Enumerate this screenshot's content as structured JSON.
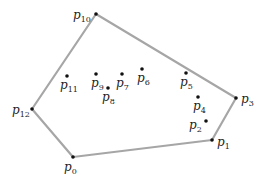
{
  "diagram": {
    "title": "",
    "hull_color": "#a6a6a6",
    "point_color": "#111111",
    "hull_order": [
      "p0",
      "p1",
      "p3",
      "p10",
      "p12"
    ],
    "points": [
      {
        "id": "p0",
        "base": "p",
        "sub": "0",
        "x": 73,
        "y": 157,
        "lx": 64,
        "ly": 171,
        "hull": true
      },
      {
        "id": "p1",
        "base": "p",
        "sub": "1",
        "x": 212,
        "y": 140,
        "lx": 217,
        "ly": 146,
        "hull": true
      },
      {
        "id": "p2",
        "base": "p",
        "sub": "2",
        "x": 206,
        "y": 121,
        "lx": 189,
        "ly": 129,
        "hull": false
      },
      {
        "id": "p3",
        "base": "p",
        "sub": "3",
        "x": 236,
        "y": 98,
        "lx": 241,
        "ly": 103,
        "hull": true
      },
      {
        "id": "p4",
        "base": "p",
        "sub": "4",
        "x": 198,
        "y": 97,
        "lx": 193,
        "ly": 110,
        "hull": false
      },
      {
        "id": "p5",
        "base": "p",
        "sub": "5",
        "x": 186,
        "y": 73,
        "lx": 180,
        "ly": 86,
        "hull": false
      },
      {
        "id": "p6",
        "base": "p",
        "sub": "6",
        "x": 142,
        "y": 69,
        "lx": 137,
        "ly": 82,
        "hull": false
      },
      {
        "id": "p7",
        "base": "p",
        "sub": "7",
        "x": 122,
        "y": 74,
        "lx": 116,
        "ly": 87,
        "hull": false
      },
      {
        "id": "p8",
        "base": "p",
        "sub": "8",
        "x": 108,
        "y": 88,
        "lx": 102,
        "ly": 101,
        "hull": false
      },
      {
        "id": "p9",
        "base": "p",
        "sub": "9",
        "x": 96,
        "y": 74,
        "lx": 91,
        "ly": 87,
        "hull": false
      },
      {
        "id": "p10",
        "base": "p",
        "sub": "10",
        "x": 96,
        "y": 14,
        "lx": 73,
        "ly": 19,
        "hull": true
      },
      {
        "id": "p11",
        "base": "p",
        "sub": "11",
        "x": 67,
        "y": 76,
        "lx": 60,
        "ly": 89,
        "hull": false
      },
      {
        "id": "p12",
        "base": "p",
        "sub": "12",
        "x": 32,
        "y": 109,
        "lx": 12,
        "ly": 114,
        "hull": true
      }
    ]
  }
}
